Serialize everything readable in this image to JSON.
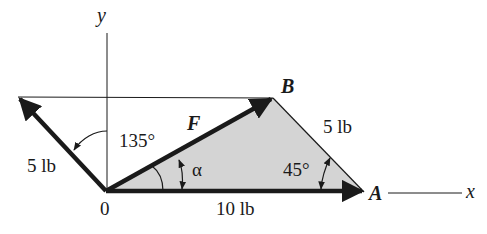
{
  "diagram": {
    "axes": {
      "x_label": "x",
      "y_label": "y",
      "origin_label": "0"
    },
    "points": {
      "A": "A",
      "B": "B"
    },
    "vectors": {
      "resultant": {
        "label": "F"
      },
      "horizontal": {
        "label": "10 lb"
      },
      "diagonal_left": {
        "label": "5 lb"
      },
      "side_BA": {
        "label": "5 lb"
      }
    },
    "angles": {
      "left_vector_angle": "135°",
      "alpha": "α",
      "at_A": "45°"
    },
    "colors": {
      "line": "#1a1a1a",
      "shade": "#d4d4d4",
      "background": "#ffffff"
    }
  }
}
